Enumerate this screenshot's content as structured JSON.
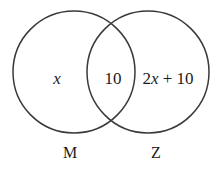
{
  "diagram": {
    "type": "venn-two-set",
    "background_color": "#ffffff",
    "stroke_color": "#3a3a3a",
    "text_color": "#1b1b1b",
    "left_circle": {
      "set_label": "M",
      "region_label": "x",
      "center_x": 74,
      "center_y": 72,
      "radius": 61
    },
    "right_circle": {
      "set_label": "Z",
      "region_label_prefix": "2",
      "region_label_variable": "x",
      "region_label_suffix": " + 10",
      "region_label_full": "2x + 10",
      "center_x": 148,
      "center_y": 72,
      "radius": 61
    },
    "intersection": {
      "label": "10"
    }
  }
}
